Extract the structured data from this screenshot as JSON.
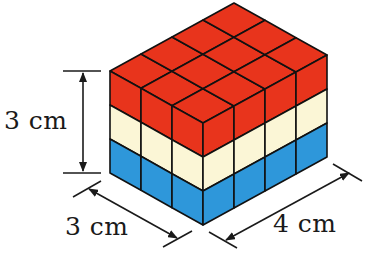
{
  "figure": {
    "dimensions": {
      "height_label": "3 cm",
      "depth_label": "3 cm",
      "width_label": "4 cm"
    },
    "grid": {
      "depth": 3,
      "width": 4,
      "layers": 3
    },
    "layers": [
      {
        "name": "top",
        "color": "#E8341C"
      },
      {
        "name": "middle",
        "color": "#FBF6D6"
      },
      {
        "name": "bottom",
        "color": "#2E97DA"
      }
    ],
    "colors": {
      "edge": "#111111",
      "dimension_line": "#1a1a1a"
    }
  }
}
